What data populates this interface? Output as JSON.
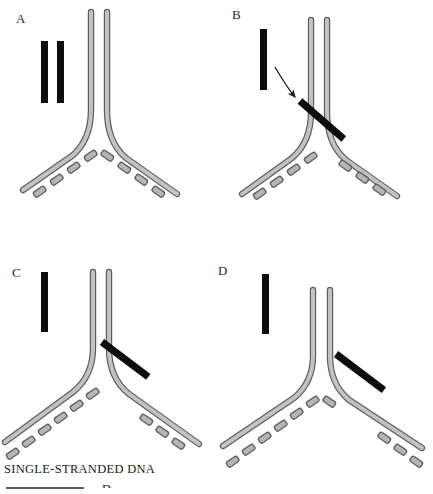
{
  "figure": {
    "background_color": "#ffffff",
    "panels": [
      {
        "id": "A",
        "label": "A",
        "description": "Replication fork with two unbound single-stranded DNA probes at left",
        "probes_free": 2,
        "probe_bound": false,
        "arrow": false
      },
      {
        "id": "B",
        "label": "B",
        "description": "One free probe remains; arrow indicates probe binding across the fork junction",
        "probes_free": 1,
        "probe_bound": true,
        "bound_position": "junction-crossing",
        "arrow": true
      },
      {
        "id": "C",
        "label": "C",
        "description": "Probe bound along the lagging strand arm starting at the junction",
        "probes_free": 1,
        "probe_bound": true,
        "bound_position": "right-arm-proximal",
        "arrow": false
      },
      {
        "id": "D",
        "label": "D",
        "description": "Probe bound further along the lagging strand arm, displaced from junction",
        "probes_free": 1,
        "probe_bound": true,
        "bound_position": "right-arm-distal",
        "arrow": false
      }
    ]
  },
  "legend": {
    "text": "SINGLE-STRANDED  DNA",
    "cut_off_label": "D"
  },
  "colors": {
    "probe": "#0d0d0d",
    "strand_fill": "#bdbdbd",
    "strand_edge": "#5e5e5e",
    "fragment_fill": "#b5b5b5",
    "fragment_edge": "#5e5e5e",
    "arrow": "#1a1a1a",
    "text": "#1a1a1a"
  }
}
